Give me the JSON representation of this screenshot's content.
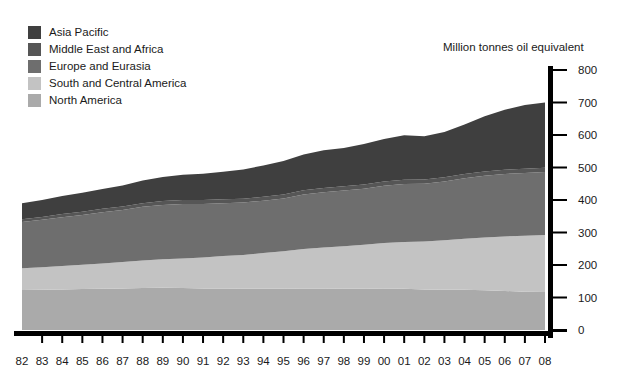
{
  "legend": {
    "items": [
      {
        "label": "Asia Pacific",
        "color": "#3f3f3f",
        "key": "asia_pacific"
      },
      {
        "label": "Middle East and Africa",
        "color": "#565656",
        "key": "middle_east_africa"
      },
      {
        "label": "Europe and Eurasia",
        "color": "#6e6e6e",
        "key": "europe_eurasia"
      },
      {
        "label": "South and Central America",
        "color": "#c3c3c3",
        "key": "south_central_america"
      },
      {
        "label": "North America",
        "color": "#aaaaaa",
        "key": "north_america"
      }
    ]
  },
  "unit_title": "Million tonnes oil equivalent",
  "chart_data": {
    "type": "area",
    "title": "",
    "subtitle": "",
    "xlabel": "",
    "ylabel": "Million tonnes oil equivalent",
    "stacked": true,
    "grid": false,
    "legend_position": "top-left",
    "ylim": [
      0,
      800
    ],
    "yticks": [
      0,
      100,
      200,
      300,
      400,
      500,
      600,
      700,
      800
    ],
    "categories": [
      "82",
      "83",
      "84",
      "85",
      "86",
      "87",
      "88",
      "89",
      "90",
      "91",
      "92",
      "93",
      "94",
      "95",
      "96",
      "97",
      "98",
      "99",
      "00",
      "01",
      "02",
      "03",
      "04",
      "05",
      "06",
      "07",
      "08"
    ],
    "series": [
      {
        "name": "North America",
        "color": "#aaaaaa",
        "values": [
          123,
          124,
          125,
          126,
          127,
          128,
          129,
          130,
          129,
          128,
          128,
          127,
          127,
          127,
          128,
          128,
          127,
          127,
          128,
          127,
          125,
          124,
          124,
          122,
          120,
          118,
          117
        ]
      },
      {
        "name": "South and Central America",
        "color": "#c3c3c3",
        "values": [
          67,
          69,
          72,
          75,
          78,
          81,
          85,
          88,
          91,
          95,
          100,
          104,
          110,
          115,
          121,
          126,
          131,
          135,
          140,
          144,
          147,
          152,
          157,
          163,
          168,
          172,
          175
        ]
      },
      {
        "name": "Europe and Eurasia",
        "color": "#6e6e6e",
        "values": [
          142,
          146,
          150,
          153,
          157,
          160,
          165,
          167,
          168,
          165,
          162,
          161,
          161,
          163,
          168,
          170,
          171,
          173,
          176,
          178,
          178,
          181,
          186,
          190,
          192,
          193,
          194
        ]
      },
      {
        "name": "Middle East and Africa",
        "color": "#565656",
        "values": [
          9,
          9,
          10,
          10,
          11,
          11,
          11,
          12,
          12,
          12,
          12,
          12,
          12,
          12,
          13,
          13,
          13,
          13,
          13,
          13,
          13,
          13,
          13,
          13,
          13,
          13,
          13
        ]
      },
      {
        "name": "Asia Pacific",
        "color": "#3f3f3f",
        "values": [
          49,
          52,
          55,
          58,
          61,
          65,
          70,
          74,
          78,
          81,
          85,
          90,
          96,
          103,
          110,
          116,
          118,
          124,
          131,
          137,
          133,
          139,
          152,
          170,
          185,
          196,
          201
        ]
      }
    ],
    "totals": [
      390,
      400,
      412,
      422,
      434,
      445,
      460,
      471,
      478,
      481,
      487,
      494,
      506,
      520,
      540,
      553,
      560,
      572,
      588,
      599,
      596,
      609,
      632,
      658,
      678,
      692,
      700
    ]
  },
  "axes": {
    "y_axis_name": "value-axis-right",
    "x_axis_name": "year-axis-bottom"
  }
}
